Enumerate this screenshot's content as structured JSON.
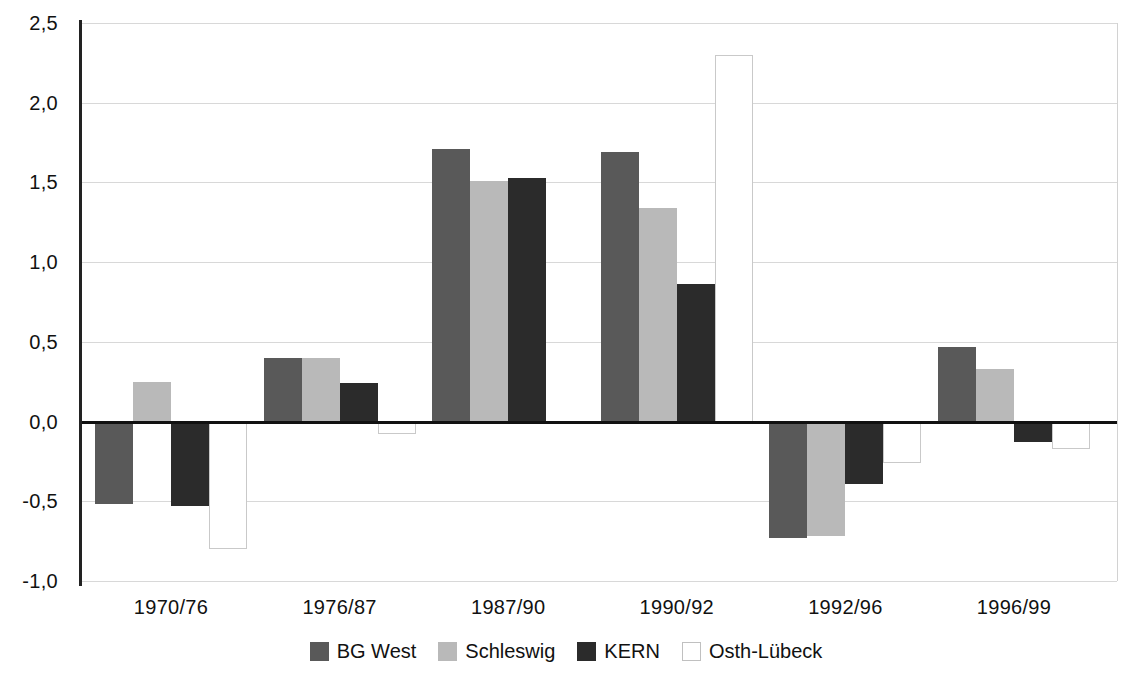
{
  "chart_data": {
    "type": "bar",
    "title": "",
    "subtitle": "",
    "xlabel": "",
    "ylabel": "",
    "categories": [
      "1970/76",
      "1976/87",
      "1987/90",
      "1990/92",
      "1992/96",
      "1996/99"
    ],
    "series": [
      {
        "name": "BG West",
        "color": "#595959",
        "values": [
          -0.52,
          0.4,
          1.71,
          1.69,
          -0.73,
          0.47
        ]
      },
      {
        "name": "Schleswig",
        "color": "#b9b9b9",
        "values": [
          0.25,
          0.4,
          1.51,
          1.34,
          -0.72,
          0.33
        ]
      },
      {
        "name": "KERN",
        "color": "#2b2b2b",
        "values": [
          -0.53,
          0.24,
          1.53,
          0.86,
          -0.39,
          -0.13
        ]
      },
      {
        "name": "Osth-Lübeck",
        "color": "#ffffff",
        "values": [
          -0.8,
          -0.08,
          0.0,
          2.3,
          -0.26,
          -0.17
        ]
      }
    ],
    "ylim": [
      -1.0,
      2.5
    ],
    "y_ticks": [
      "2,5",
      "2,0",
      "1,5",
      "1,0",
      "0,5",
      "0,0",
      "-0,5",
      "-1,0"
    ],
    "y_tick_values": [
      2.5,
      2.0,
      1.5,
      1.0,
      0.5,
      0.0,
      -0.5,
      -1.0
    ],
    "grid": true,
    "legend_position": "bottom",
    "baseline_value": 0.0
  },
  "legend": {
    "items": [
      {
        "label": "BG West"
      },
      {
        "label": "Schleswig"
      },
      {
        "label": "KERN"
      },
      {
        "label": "Osth-Lübeck"
      }
    ]
  }
}
